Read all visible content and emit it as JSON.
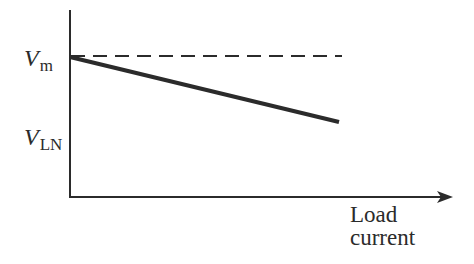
{
  "diagram": {
    "title": "",
    "y_labels": {
      "vm": {
        "main": "V",
        "sub": "m"
      },
      "vln": {
        "main": "V",
        "sub": "LN"
      }
    },
    "x_label": {
      "line1": "Load",
      "line2": "current"
    },
    "lines": [
      {
        "name": "no-load voltage reference",
        "style": "dashed",
        "from_label": "Vm"
      },
      {
        "name": "terminal voltage vs load",
        "style": "solid-thick",
        "trend": "decreasing from Vm toward VLN"
      }
    ],
    "colors": {
      "ink": "#2b2b2b",
      "background": "#ffffff"
    }
  }
}
